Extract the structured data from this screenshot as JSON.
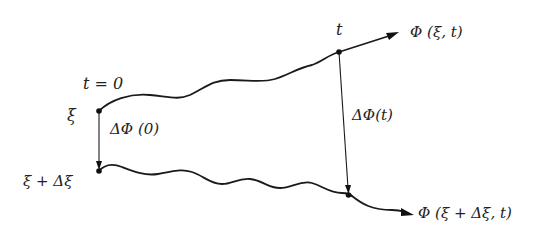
{
  "diagram": {
    "labels": {
      "t0": "t = 0",
      "xi": "ξ",
      "xi_plus_dxi": "ξ + Δξ",
      "t": "t",
      "dphi0": "ΔΦ (0)",
      "dphit": "ΔΦ(t)",
      "phi_xi_t": "Φ (ξ, t)",
      "phi_xi_dxi_t": "Φ (ξ + Δξ, t)"
    },
    "nodes": [
      {
        "id": "start-upper",
        "label_ref": "xi"
      },
      {
        "id": "end-upper",
        "label_ref": "t"
      },
      {
        "id": "start-lower",
        "label_ref": "xi_plus_dxi"
      },
      {
        "id": "end-lower",
        "label_ref": "phi_xi_dxi_t"
      }
    ],
    "edges": [
      {
        "id": "trajectory-upper",
        "from": "start-upper",
        "to": "end-upper",
        "style": "wavy",
        "arrow_label_ref": "phi_xi_t"
      },
      {
        "id": "trajectory-lower",
        "from": "start-lower",
        "to": "end-lower",
        "style": "wavy",
        "arrow_label_ref": "phi_xi_dxi_t"
      },
      {
        "id": "separation-initial",
        "from": "start-upper",
        "to": "start-lower",
        "style": "arrow",
        "label_ref": "dphi0"
      },
      {
        "id": "separation-final",
        "from": "end-upper",
        "to": "end-lower",
        "style": "arrow",
        "label_ref": "dphit"
      }
    ],
    "colors": {
      "ink": "#1a1a1a",
      "background": "#ffffff"
    }
  }
}
